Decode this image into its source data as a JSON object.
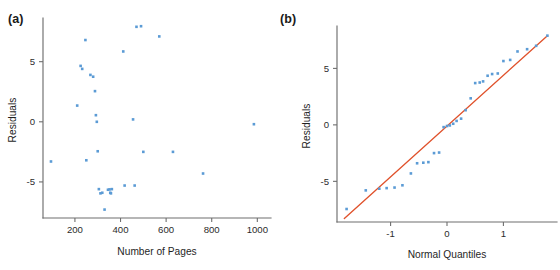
{
  "figure": {
    "background": "#ffffff",
    "marker_color": "#5b9bd5",
    "line_color": "#e0522c",
    "axis_color": "#6e6e6e"
  },
  "panels": [
    {
      "id": "a",
      "label": "(a)"
    },
    {
      "id": "b",
      "label": "(b)"
    }
  ],
  "chart_data": [
    {
      "type": "scatter",
      "panel": "(a)",
      "title": "",
      "xlabel": "Number of Pages",
      "ylabel": "Residuals",
      "xlim": [
        60,
        1060
      ],
      "ylim": [
        -8.0,
        8.3
      ],
      "xticks": [
        200,
        400,
        600,
        800,
        1000
      ],
      "xtick_labels": [
        "200",
        "400",
        "600",
        "800",
        "1000"
      ],
      "yticks": [
        -5,
        0,
        5
      ],
      "ytick_labels": [
        "-5",
        "0",
        "5"
      ],
      "grid": false,
      "legend": "none",
      "marker": "square",
      "x": [
        95,
        210,
        225,
        232,
        246,
        250,
        268,
        280,
        288,
        292,
        296,
        300,
        305,
        312,
        320,
        330,
        345,
        352,
        355,
        358,
        362,
        412,
        418,
        455,
        462,
        470,
        490,
        500,
        570,
        630,
        762,
        985
      ],
      "y": [
        -3.3,
        1.35,
        4.65,
        4.4,
        6.8,
        -3.2,
        3.9,
        3.75,
        2.55,
        0.55,
        0.0,
        -2.45,
        -5.6,
        -5.95,
        -5.9,
        -7.3,
        -5.65,
        -5.62,
        -5.9,
        -5.95,
        -5.6,
        5.85,
        -5.3,
        0.2,
        -5.3,
        7.9,
        7.95,
        -2.5,
        7.1,
        -2.5,
        -4.3,
        -0.2
      ]
    },
    {
      "type": "scatter",
      "panel": "(b)",
      "title": "",
      "xlabel": "Normal Quantiles",
      "ylabel": "Residuals",
      "xlim": [
        -1.95,
        1.95
      ],
      "ylim": [
        -8.6,
        8.4
      ],
      "xticks": [
        -1,
        0,
        1
      ],
      "xtick_labels": [
        "-1",
        "0",
        "1"
      ],
      "yticks": [
        -5,
        0,
        5
      ],
      "ytick_labels": [
        "-5",
        "0",
        "5"
      ],
      "grid": false,
      "legend": "none",
      "marker": "square",
      "reference_line": {
        "x": [
          -1.82,
          1.78
        ],
        "y": [
          -8.3,
          7.9
        ],
        "color": "#e0522c"
      },
      "x": [
        -1.78,
        -1.44,
        -1.2,
        -1.07,
        -0.93,
        -0.79,
        -0.64,
        -0.53,
        -0.42,
        -0.33,
        -0.23,
        -0.14,
        -0.06,
        0.0,
        0.05,
        0.11,
        0.17,
        0.25,
        0.33,
        0.42,
        0.5,
        0.58,
        0.64,
        0.72,
        0.8,
        0.9,
        1.0,
        1.12,
        1.25,
        1.42,
        1.58,
        1.78
      ],
      "y": [
        -7.45,
        -5.8,
        -5.65,
        -5.6,
        -5.55,
        -5.35,
        -4.3,
        -3.4,
        -3.35,
        -3.3,
        -2.5,
        -2.45,
        -0.2,
        -0.1,
        -0.05,
        0.1,
        0.35,
        0.55,
        1.3,
        2.35,
        3.7,
        3.75,
        3.85,
        4.35,
        4.5,
        4.55,
        5.65,
        5.75,
        6.5,
        6.7,
        7.0,
        7.9
      ]
    }
  ]
}
